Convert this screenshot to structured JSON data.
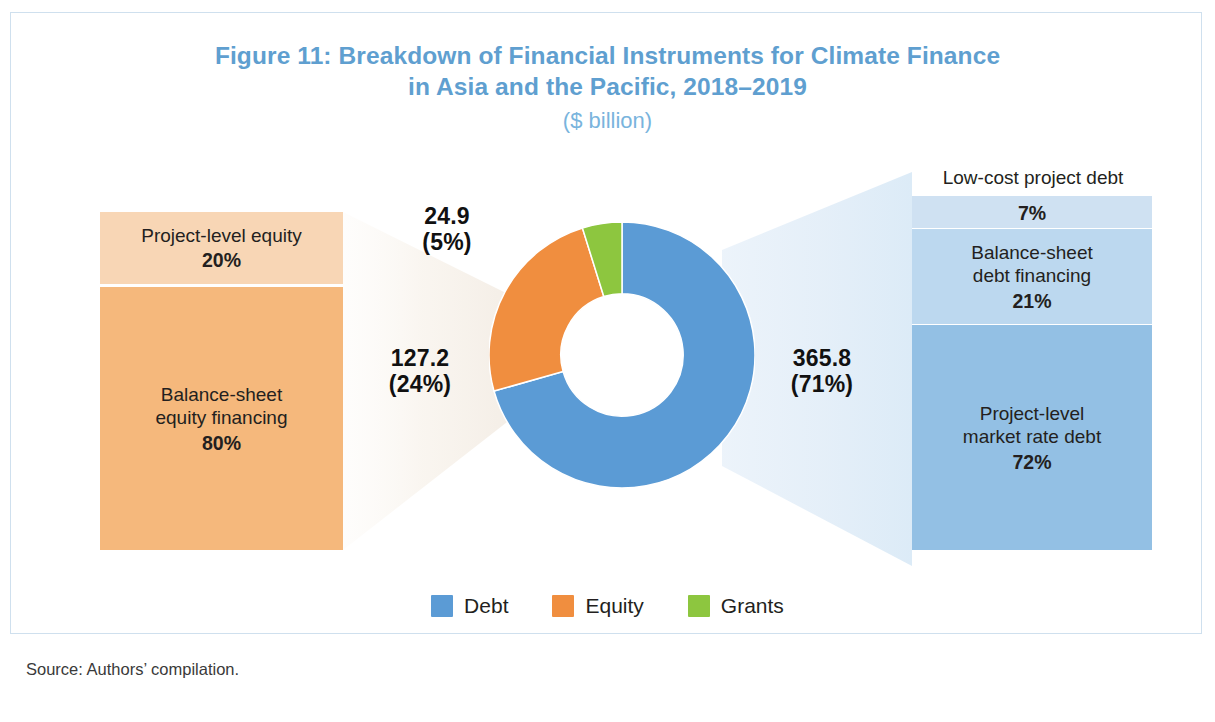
{
  "figure": {
    "title_line1": "Figure 11: Breakdown of Financial Instruments for Climate Finance",
    "title_line2": "in Asia and the Pacific, 2018–2019",
    "subtitle": "($ billion)",
    "source": "Source: Authors’ compilation."
  },
  "legend": {
    "items": [
      {
        "label": "Debt",
        "color": "#5b9bd5"
      },
      {
        "label": "Equity",
        "color": "#f08e3f"
      },
      {
        "label": "Grants",
        "color": "#8dc63f"
      }
    ]
  },
  "callouts": {
    "debt": {
      "value": "365.8",
      "share": "(71%)"
    },
    "equity": {
      "value": "127.2",
      "share": "(24%)"
    },
    "grants": {
      "value": "24.9",
      "share": "(5%)"
    }
  },
  "equity_panel": {
    "segments": [
      {
        "label": "Project-level equity",
        "pct": "20%",
        "color": "#f8d6b5"
      },
      {
        "label": "Balance-sheet\nequity financing",
        "pct": "80%",
        "color": "#f5b87c"
      }
    ]
  },
  "debt_panel": {
    "overhang_label": "Low-cost project debt",
    "segments": [
      {
        "label": "",
        "pct": "7%",
        "color": "#cfe1f2"
      },
      {
        "label": "Balance-sheet\ndebt financing",
        "pct": "21%",
        "color": "#bcd8ef"
      },
      {
        "label": "Project-level\nmarket rate debt",
        "pct": "72%",
        "color": "#93c0e4"
      }
    ]
  },
  "chart_data": {
    "type": "pie",
    "title": "Figure 11: Breakdown of Financial Instruments for Climate Finance in Asia and the Pacific, 2018–2019",
    "subtitle": "($ billion)",
    "units": "$ billion",
    "legend_position": "bottom",
    "grid": false,
    "labels": [
      "Debt",
      "Equity",
      "Grants"
    ],
    "values": [
      365.8,
      127.2,
      24.9
    ],
    "percents": [
      71,
      24,
      5
    ],
    "colors": [
      "#5b9bd5",
      "#f08e3f",
      "#8dc63f"
    ],
    "donut": true,
    "inner_radius_ratio": 0.46,
    "start_angle_deg": 0,
    "direction": "clockwise",
    "annotations": [
      "365.8 (71%)",
      "127.2 (24%)",
      "24.9 (5%)"
    ],
    "breakdowns": [
      {
        "parent": "Debt",
        "total": 365.8,
        "categories": [
          "Low-cost project debt",
          "Balance-sheet debt financing",
          "Project-level market rate debt"
        ],
        "values": [
          7,
          21,
          72
        ],
        "value_labels": [
          "7%",
          "21%",
          "72%"
        ],
        "colors": [
          "#cfe1f2",
          "#bcd8ef",
          "#93c0e4"
        ]
      },
      {
        "parent": "Equity",
        "total": 127.2,
        "categories": [
          "Project-level equity",
          "Balance-sheet equity financing"
        ],
        "values": [
          20,
          80
        ],
        "value_labels": [
          "20%",
          "80%"
        ],
        "colors": [
          "#f8d6b5",
          "#f5b87c"
        ]
      }
    ],
    "source": "Source: Authors’ compilation."
  }
}
